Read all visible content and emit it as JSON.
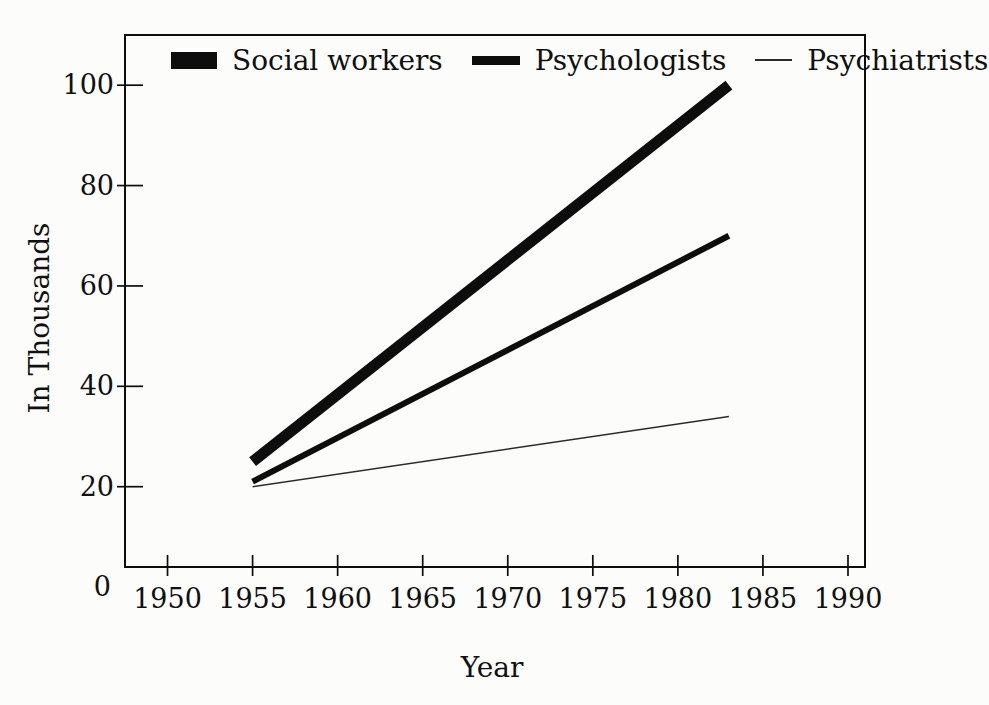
{
  "figure": {
    "background": "#fcfcfa",
    "ink": "#0d0d0d"
  },
  "chart_data": {
    "type": "line",
    "title": "",
    "xlabel": "Year",
    "ylabel": "In Thousands",
    "origin_label": "0",
    "x_ticks": [
      1950,
      1955,
      1960,
      1965,
      1970,
      1975,
      1980,
      1985,
      1990
    ],
    "y_ticks": [
      20,
      40,
      60,
      80,
      100
    ],
    "xlim": [
      1947.5,
      1991
    ],
    "ylim": [
      4,
      110
    ],
    "grid": false,
    "legend_position": "top-inside",
    "series": [
      {
        "name": "Social workers",
        "x": [
          1955,
          1983
        ],
        "y": [
          25,
          100
        ],
        "line_width": 11,
        "color": "#0d0d0d"
      },
      {
        "name": "Psychologists",
        "x": [
          1955,
          1983
        ],
        "y": [
          21,
          70
        ],
        "line_width": 6,
        "color": "#0d0d0d"
      },
      {
        "name": "Psychiatrists",
        "x": [
          1955,
          1983
        ],
        "y": [
          20,
          34
        ],
        "line_width": 1.5,
        "color": "#2b2b2b"
      }
    ]
  }
}
